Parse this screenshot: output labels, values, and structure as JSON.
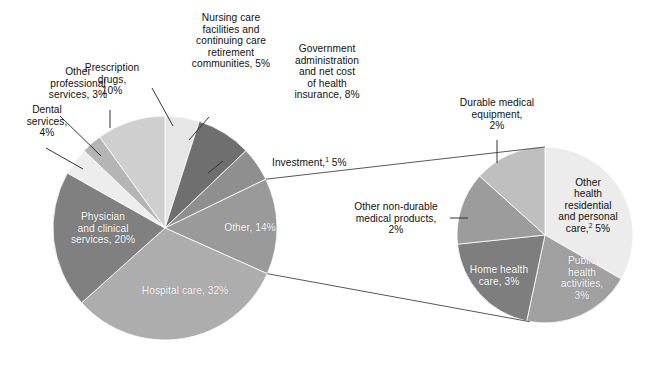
{
  "figure": {
    "kind": "two-pie-with-callout",
    "background": "#ffffff",
    "leader_line_color": "#333333"
  },
  "chart_data": {
    "type": "pie",
    "title": "",
    "subtitle": "",
    "xlabel": "",
    "ylabel": "",
    "legend_position": "none",
    "grid": false,
    "charts": [
      {
        "name": "main-pie",
        "center": [
          165,
          228
        ],
        "radius": 112,
        "start_angle_deg": 0,
        "direction": "clockwise",
        "categories": [
          "Nursing care facilities and continuing care retirement communities",
          "Government administration and net cost of health insurance",
          "Investment",
          "Other",
          "Hospital care",
          "Physician and clinical services",
          "Dental services",
          "Other professional services",
          "Prescription drugs"
        ],
        "values": [
          5,
          8,
          5,
          14,
          32,
          20,
          4,
          3,
          10
        ],
        "units": "percent",
        "colors": [
          "#e6e6e6",
          "#6f6f6f",
          "#8f8f8f",
          "#9a9a9a",
          "#adadad",
          "#808080",
          "#ededed",
          "#b5b5b5",
          "#cfcfcf"
        ]
      },
      {
        "name": "detail-pie",
        "note": "Expanded breakdown of the main pie 'Other, 14%' slice",
        "center": [
          545,
          235
        ],
        "radius": 88,
        "start_angle_deg": 0,
        "direction": "clockwise",
        "categories": [
          "Other health residential and personal care",
          "Public health activities",
          "Home health care",
          "Other non-durable medical products",
          "Durable medical equipment"
        ],
        "values": [
          5,
          3,
          3,
          2,
          2
        ],
        "units": "percent",
        "colors": [
          "#ececec",
          "#a0a0a0",
          "#7e7e7e",
          "#9c9c9c",
          "#bfbfbf"
        ]
      }
    ]
  },
  "labels": {
    "main": {
      "other_professional": "Other\nprofessional\nservices, 3%",
      "dental": "Dental\nservices,\n4%",
      "prescription": "Prescription\ndrugs,\n10%",
      "nursing": "Nursing care\nfacilities and\ncontinuing care\nretirement\ncommunities, 5%",
      "government": "Government\nadministration\nand net cost\nof health\ninsurance, 8%",
      "investment_text": "Investment,",
      "investment_sup": "1",
      "investment_value": " 5%",
      "other": "Other, 14%",
      "hospital": "Hospital care, 32%",
      "physician": "Physician\nand clinical\nservices, 20%"
    },
    "detail": {
      "durable": "Durable medical\nequipment,\n2%",
      "nondurable": "Other non-durable\nmedical products,\n2%",
      "other_health_text": "Other\nhealth\nresidential\nand personal\ncare,",
      "other_health_sup": "2",
      "other_health_value": " 5%",
      "public_health": "Public\nhealth\nactivities,\n3%",
      "home_health": "Home health\ncare, 3%"
    }
  }
}
